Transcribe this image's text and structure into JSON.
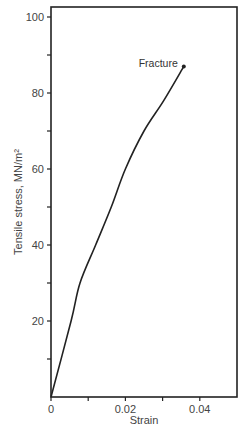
{
  "chart_data": {
    "type": "line",
    "title": "",
    "xlabel": "Strain",
    "ylabel": "Tensile stress, MN/m²",
    "xlim": [
      0,
      0.05
    ],
    "ylim": [
      0,
      102
    ],
    "x_ticks": [
      0,
      0.01,
      0.02,
      0.03,
      0.04
    ],
    "x_tick_labels": [
      "0",
      "",
      "0.02",
      "",
      "0.04"
    ],
    "y_ticks": [
      10,
      20,
      30,
      40,
      50,
      60,
      70,
      80,
      90,
      100
    ],
    "y_tick_labels": [
      "",
      "20",
      "",
      "40",
      "",
      "60",
      "",
      "80",
      "",
      "100"
    ],
    "grid": false,
    "legend": null,
    "series": [
      {
        "name": "Stress-strain curve",
        "x": [
          0,
          0.0054,
          0.0078,
          0.012,
          0.0162,
          0.02,
          0.025,
          0.0303,
          0.0357
        ],
        "y": [
          0,
          20,
          30,
          40,
          50,
          60,
          70,
          78,
          87
        ]
      }
    ],
    "annotations": [
      {
        "text": "Fracture",
        "x": 0.0357,
        "y": 87,
        "marker": "dot"
      }
    ]
  }
}
